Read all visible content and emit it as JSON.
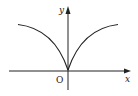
{
  "diagram": {
    "type": "function-graph",
    "axes": {
      "x_label": "x",
      "y_label": "y",
      "origin_label": "O"
    },
    "curve": {
      "description": "even function, cusp at origin, increasing and concave down for x>0",
      "color": "#222222"
    },
    "colors": {
      "axis": "#222222",
      "background": "#ffffff"
    }
  }
}
